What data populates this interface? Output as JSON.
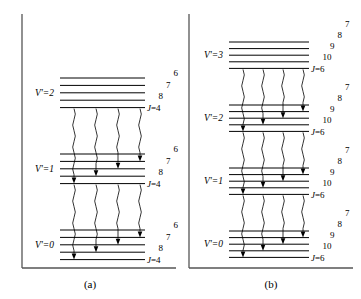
{
  "figure": {
    "type": "energy-level-diagram",
    "background": "#ffffff",
    "line_color": "#000000",
    "panel_count": 2
  },
  "panels": [
    {
      "id": "a",
      "caption": "(a)",
      "vib_label_prefix": "V'",
      "j_label_prefix": "J=",
      "j_base_label": "J=4",
      "j_numbers": [
        "8",
        "7",
        "6",
        "5"
      ],
      "blocks": [
        {
          "vib_label": "V'=2",
          "levels": [
            "8",
            "7",
            "6",
            "5",
            "4"
          ]
        },
        {
          "vib_label": "V'=1",
          "levels": [
            "8",
            "7",
            "6",
            "5",
            "4"
          ]
        },
        {
          "vib_label": "V'=0",
          "levels": [
            "8",
            "7",
            "6",
            "5",
            "4"
          ]
        }
      ],
      "transition_count": 4
    },
    {
      "id": "b",
      "caption": "(b)",
      "vib_label_prefix": "V'",
      "j_label_prefix": "J=",
      "j_base_label": "J=6",
      "j_numbers": [
        "10",
        "9",
        "8",
        "7"
      ],
      "blocks": [
        {
          "vib_label": "V'=3",
          "levels": [
            "10",
            "9",
            "8",
            "7",
            "6"
          ]
        },
        {
          "vib_label": "V'=2",
          "levels": [
            "10",
            "9",
            "8",
            "7",
            "6"
          ]
        },
        {
          "vib_label": "V'=1",
          "levels": [
            "10",
            "9",
            "8",
            "7",
            "6"
          ]
        },
        {
          "vib_label": "V'=0",
          "levels": [
            "10",
            "9",
            "8",
            "7",
            "6"
          ]
        }
      ],
      "transition_count": 4
    }
  ]
}
